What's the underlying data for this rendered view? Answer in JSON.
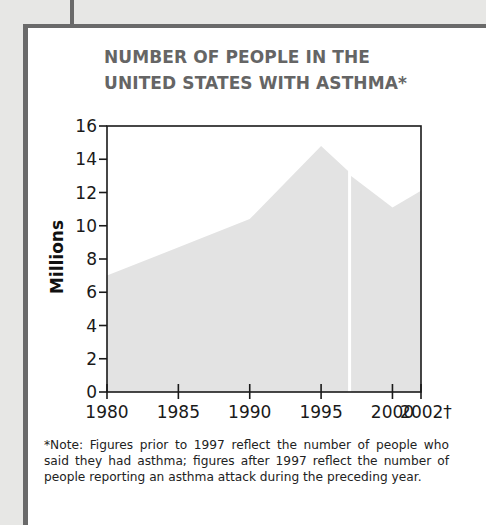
{
  "chart_data": {
    "type": "area",
    "title": "NUMBER OF PEOPLE IN THE UNITED STATES WITH ASTHMA*",
    "title_lines": [
      "NUMBER OF PEOPLE IN THE",
      "UNITED STATES WITH ASTHMA*"
    ],
    "xlabel": "",
    "ylabel": "Millions",
    "ylim": [
      0,
      16
    ],
    "xlim": [
      1980,
      2002
    ],
    "yticks": [
      0,
      2,
      4,
      6,
      8,
      10,
      12,
      14,
      16
    ],
    "xticks": [
      1980,
      1985,
      1990,
      1995,
      2000,
      2002
    ],
    "xtick_labels": [
      "1980",
      "1985",
      "1990",
      "1995",
      "2000",
      "2002†"
    ],
    "grid": false,
    "legend": null,
    "break_at": 1997,
    "series": [
      {
        "name": "Self-reported asthma (before 1997)",
        "x": [
          1980,
          1990,
          1995,
          1997
        ],
        "values": [
          7.0,
          10.4,
          14.8,
          13.3
        ]
      },
      {
        "name": "Asthma attack in preceding year (after 1997)",
        "x": [
          1997,
          2000,
          2002
        ],
        "values": [
          13.0,
          11.1,
          12.1
        ]
      }
    ],
    "fill_color": "#e3e3e3",
    "note": "*Note: Figures prior to 1997 reflect the number of people who said they had asthma; figures after 1997 reflect the number of people reporting an asthma attack during the preceding year."
  }
}
